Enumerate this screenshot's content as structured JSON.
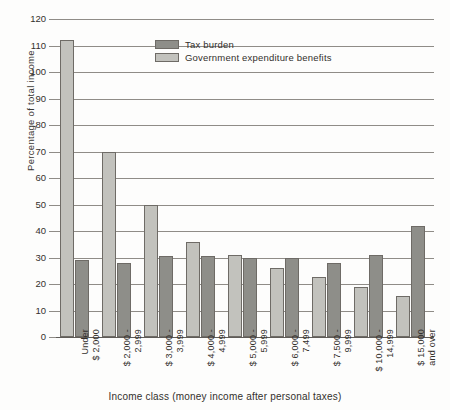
{
  "chart_data": {
    "type": "bar",
    "title": "",
    "xlabel": "Income class (money income after personal taxes)",
    "ylabel": "Percentage of total income",
    "ylim": [
      0,
      120
    ],
    "ytick_step": 10,
    "yticks": [
      "120",
      "110",
      "100",
      "90",
      "80",
      "70",
      "60",
      "50",
      "40",
      "30",
      "20",
      "10",
      "0"
    ],
    "grid": true,
    "legend_position": "top-center",
    "categories": [
      "Under\n$ 2,000",
      "$ 2,000 -\n2,999",
      "$ 3,000 -\n3,999",
      "$ 4,000 -\n4,999",
      "$ 5,000 -\n5,999",
      "$ 6,000 -\n7,499",
      "$ 7,500 -\n9,999",
      "$ 10,000 -\n14,999",
      "$ 15,000\nand over"
    ],
    "series": [
      {
        "name": "Government expenditure benefits",
        "color": "#c2c2bd",
        "values": [
          112,
          70,
          50,
          36,
          31,
          26,
          22.5,
          19,
          15.5
        ]
      },
      {
        "name": "Tax burden",
        "color": "#8e8e89",
        "values": [
          29,
          28,
          30.5,
          30.5,
          30,
          30,
          28,
          31,
          42
        ]
      }
    ]
  },
  "legend": {
    "entries": [
      {
        "label": "Tax burden",
        "swatch": "burden"
      },
      {
        "label": "Government expenditure benefits",
        "swatch": "benefits"
      }
    ]
  },
  "axes": {
    "y_title": "Percentage of total income",
    "x_title": "Income class (money income after personal taxes)"
  }
}
